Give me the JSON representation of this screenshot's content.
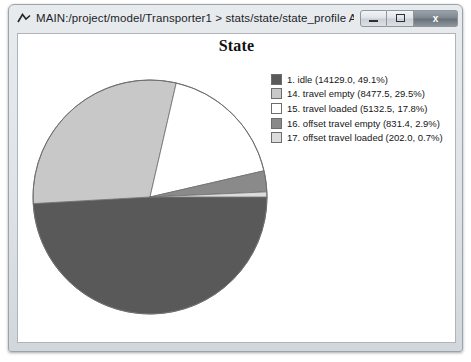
{
  "window": {
    "title": "MAIN:/project/model/Transporter1 > stats/state/state_profile As Graph",
    "icon_name": "chart-peak-icon",
    "buttons": {
      "minimize_label": "",
      "maximize_label": "",
      "close_label": "x"
    }
  },
  "chart_data": {
    "type": "pie",
    "title": "State",
    "xlabel": "",
    "ylabel": "",
    "legend_position": "right",
    "grid": false,
    "categories": [
      "1. idle",
      "14. travel empty",
      "15. travel loaded",
      "16. offset travel empty",
      "17. offset travel loaded"
    ],
    "values": [
      14129.0,
      8477.5,
      5132.5,
      831.4,
      202.0
    ],
    "percents": [
      49.1,
      29.5,
      17.8,
      2.9,
      0.7
    ],
    "colors": [
      "#595959",
      "#c8c8c8",
      "#ffffff",
      "#8a8a8a",
      "#dcdcdc"
    ],
    "legend_entries": [
      "1. idle (14129.0, 49.1%)",
      "14. travel empty (8477.5, 29.5%)",
      "15. travel loaded (5132.5, 17.8%)",
      "16. offset travel empty (831.4, 2.9%)",
      "17. offset travel loaded (202.0, 0.7%)"
    ]
  }
}
